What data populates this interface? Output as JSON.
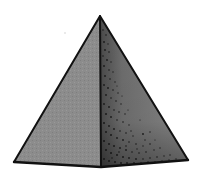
{
  "figure": {
    "label": "Square pyramid",
    "shape": "pyramid",
    "view": "perspective, front edge facing viewer",
    "faces_visible": 2,
    "colors": {
      "background": "#ffffff",
      "outline": "#111111",
      "left_face": "#8c8c8c",
      "right_face": "#7a7a7a",
      "stipple": "#1a1a1a"
    },
    "vertices": {
      "apex": [
        100,
        16
      ],
      "base_left": [
        14,
        162
      ],
      "base_front": [
        101,
        167
      ],
      "base_right": [
        188,
        160
      ]
    }
  }
}
